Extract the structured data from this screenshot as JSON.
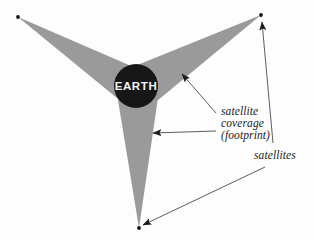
{
  "figure": {
    "background_color": "#fdfdfd",
    "earth": {
      "label": "EARTH",
      "fill_color": "#171717",
      "text_color": "#f4f4f4",
      "center_x": 136,
      "center_y": 86,
      "radius": 22
    },
    "footprint": {
      "fill_color": "#9a9a9a",
      "beams": 3,
      "tips": [
        {
          "name": "upper-left-satellite",
          "x": 18,
          "y": 17
        },
        {
          "name": "upper-right-satellite",
          "x": 261,
          "y": 15
        },
        {
          "name": "bottom-satellite",
          "x": 139,
          "y": 228
        }
      ]
    },
    "annotations": [
      {
        "name": "satellite-coverage-label",
        "lines": [
          "satellite",
          "coverage",
          "(footprint)"
        ],
        "line1": "satellite",
        "line2": "coverage",
        "line3": "(footprint)"
      },
      {
        "name": "satellites-label",
        "text": "satellites"
      }
    ],
    "leader_lines": {
      "coverage_upper": "from label to upper-right beam",
      "coverage_lower": "from label to lower beam",
      "satellites_upper": "from label to upper-right satellite",
      "satellites_lower": "from label to bottom satellite"
    },
    "stroke_color": "#4a4a4a"
  }
}
